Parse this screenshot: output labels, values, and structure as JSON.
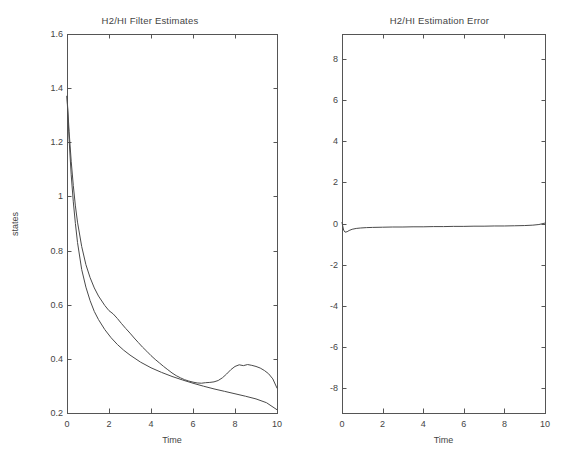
{
  "figure": {
    "background": "#ffffff",
    "line_color": "#4a4a4a",
    "axis_color": "#555555",
    "width": 579,
    "height": 476
  },
  "chart_data": [
    {
      "type": "line",
      "panel": "left",
      "title": "H2/HI Filter Estimates",
      "xlabel": "Time",
      "ylabel": "states",
      "xlim": [
        0,
        10
      ],
      "ylim": [
        0.2,
        1.6
      ],
      "xticks": [
        0,
        2,
        4,
        6,
        8,
        10
      ],
      "yticks": [
        0.2,
        0.4,
        0.6,
        0.8,
        1,
        1.2,
        1.4,
        1.6
      ],
      "xticklabels": [
        "0",
        "2",
        "4",
        "6",
        "8",
        "10"
      ],
      "yticklabels": [
        "0.2",
        "0.4",
        "0.6",
        "0.8",
        "1",
        "1.2",
        "1.4",
        "1.6"
      ],
      "grid": false,
      "legend": "none",
      "series": [
        {
          "name": "smooth-estimate",
          "x": [
            0,
            0.1,
            0.2,
            0.3,
            0.4,
            0.5,
            0.7,
            0.9,
            1.1,
            1.3,
            1.5,
            1.8,
            2.1,
            2.4,
            2.7,
            3.0,
            3.5,
            4.0,
            4.5,
            5.0,
            5.5,
            6.0,
            6.5,
            7.0,
            7.5,
            8.0,
            8.5,
            9.0,
            9.5,
            10.0
          ],
          "values": [
            1.37,
            1.21,
            1.08,
            0.98,
            0.9,
            0.83,
            0.73,
            0.665,
            0.615,
            0.575,
            0.545,
            0.508,
            0.478,
            0.453,
            0.432,
            0.414,
            0.388,
            0.367,
            0.35,
            0.335,
            0.322,
            0.31,
            0.299,
            0.289,
            0.28,
            0.271,
            0.262,
            0.252,
            0.238,
            0.212
          ]
        },
        {
          "name": "noisy-estimate",
          "x": [
            0,
            0.1,
            0.2,
            0.3,
            0.4,
            0.5,
            0.7,
            0.9,
            1.1,
            1.3,
            1.5,
            1.8,
            2.0,
            2.2,
            2.4,
            2.6,
            2.8,
            3.0,
            3.2,
            3.4,
            3.6,
            3.8,
            4.0,
            4.2,
            4.4,
            4.6,
            4.8,
            5.0,
            5.2,
            5.4,
            5.6,
            5.8,
            6.0,
            6.2,
            6.4,
            6.6,
            6.8,
            7.0,
            7.2,
            7.4,
            7.6,
            7.8,
            8.0,
            8.2,
            8.4,
            8.6,
            8.8,
            9.0,
            9.2,
            9.4,
            9.6,
            9.8,
            10.0
          ],
          "values": [
            1.37,
            1.24,
            1.13,
            1.04,
            0.965,
            0.905,
            0.815,
            0.748,
            0.7,
            0.662,
            0.632,
            0.597,
            0.578,
            0.566,
            0.549,
            0.53,
            0.512,
            0.495,
            0.477,
            0.46,
            0.443,
            0.428,
            0.412,
            0.398,
            0.385,
            0.372,
            0.36,
            0.348,
            0.338,
            0.33,
            0.323,
            0.318,
            0.314,
            0.311,
            0.31,
            0.312,
            0.313,
            0.315,
            0.32,
            0.33,
            0.344,
            0.36,
            0.372,
            0.378,
            0.375,
            0.379,
            0.376,
            0.372,
            0.366,
            0.357,
            0.345,
            0.326,
            0.292
          ]
        }
      ]
    },
    {
      "type": "line",
      "panel": "right",
      "title": "H2/HI Estimation Error",
      "xlabel": "Time",
      "ylabel": "",
      "xlim": [
        0,
        10
      ],
      "ylim": [
        -9.2,
        9.2
      ],
      "xticks": [
        0,
        2,
        4,
        6,
        8,
        10
      ],
      "yticks": [
        -8,
        -6,
        -4,
        -2,
        0,
        2,
        4,
        6,
        8
      ],
      "xticklabels": [
        "0",
        "2",
        "4",
        "6",
        "8",
        "10"
      ],
      "yticklabels": [
        "-8",
        "-6",
        "-4",
        "-2",
        "0",
        "2",
        "4",
        "6",
        "8"
      ],
      "grid": false,
      "legend": "none",
      "series": [
        {
          "name": "estimation-error",
          "x": [
            0,
            0.08,
            0.15,
            0.25,
            0.35,
            0.5,
            0.7,
            0.9,
            1.2,
            1.5,
            2.0,
            2.5,
            3.0,
            3.5,
            4.0,
            4.5,
            5.0,
            5.5,
            6.0,
            6.5,
            7.0,
            7.5,
            8.0,
            8.5,
            9.0,
            9.4,
            9.7,
            10.0
          ],
          "values": [
            0.05,
            -0.32,
            -0.42,
            -0.4,
            -0.34,
            -0.28,
            -0.24,
            -0.22,
            -0.2,
            -0.19,
            -0.18,
            -0.17,
            -0.17,
            -0.16,
            -0.16,
            -0.15,
            -0.15,
            -0.14,
            -0.14,
            -0.13,
            -0.13,
            -0.12,
            -0.12,
            -0.11,
            -0.1,
            -0.08,
            -0.05,
            0.02
          ]
        }
      ]
    }
  ]
}
